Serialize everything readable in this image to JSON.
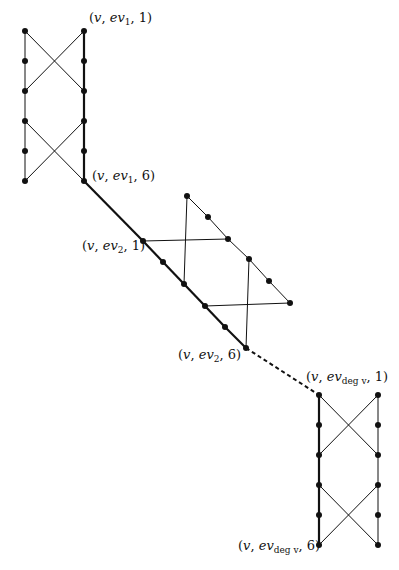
{
  "diagram": {
    "colors": {
      "line": "#111111",
      "node": "#111111",
      "background": "#ffffff"
    },
    "labels": {
      "ev1_1": {
        "pre": "(",
        "v": "v",
        "comma": ", ",
        "ev": "ev",
        "sub": "1",
        "post": ", 1)"
      },
      "ev1_6": {
        "pre": "(",
        "v": "v",
        "comma": ", ",
        "ev": "ev",
        "sub": "1",
        "post": ", 6)"
      },
      "ev2_1": {
        "pre": "(",
        "v": "v",
        "comma": ", ",
        "ev": "ev",
        "sub": "2",
        "post": ", 1)"
      },
      "ev2_6": {
        "pre": "(",
        "v": "v",
        "comma": ", ",
        "ev": "ev",
        "sub": "2",
        "post": ", 6)"
      },
      "evdeg_1": {
        "pre": "(",
        "v": "v",
        "comma": ", ",
        "ev": "ev",
        "sub": "deg v",
        "post": ", 1)"
      },
      "evdeg_6": {
        "pre": "(",
        "v": "v",
        "comma": ", ",
        "ev": "ev",
        "sub": "deg v",
        "post": ", 6)"
      }
    },
    "gadgets": [
      {
        "name": "gadget-ev1",
        "left_x": 25,
        "right_x": 84,
        "rows_y": [
          31,
          61,
          91,
          121,
          151,
          181
        ]
      },
      {
        "name": "gadget-ev2",
        "outer": [
          [
            187,
            196
          ],
          [
            208,
            217
          ],
          [
            228,
            239
          ],
          [
            249,
            259
          ],
          [
            269,
            281
          ],
          [
            290,
            303
          ]
        ],
        "inner": [
          [
            143,
            241
          ],
          [
            163,
            262
          ],
          [
            184,
            284
          ],
          [
            205,
            306
          ],
          [
            225,
            327
          ],
          [
            246,
            348
          ]
        ]
      },
      {
        "name": "gadget-evdeg",
        "left_x": 319,
        "right_x": 378,
        "rows_y": [
          395,
          425,
          455,
          485,
          515,
          545
        ]
      }
    ]
  }
}
